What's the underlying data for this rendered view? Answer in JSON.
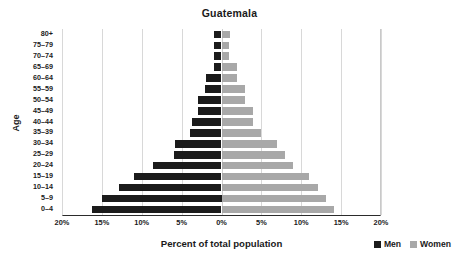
{
  "chart_data": {
    "type": "bar",
    "subtype": "population-pyramid",
    "title": "Guatemala",
    "xlabel": "Percent of total population",
    "ylabel": "Age",
    "categories": [
      "0–4",
      "5–9",
      "10–14",
      "15–19",
      "20–24",
      "25–29",
      "30–34",
      "35–39",
      "40–44",
      "45–49",
      "50–54",
      "55–59",
      "60–64",
      "65–69",
      "70–74",
      "75–79",
      "80+"
    ],
    "series": [
      {
        "name": "Men",
        "color": "#1b1b1b",
        "direction": "left",
        "values": [
          16.3,
          15.0,
          12.8,
          11.0,
          8.6,
          6.0,
          5.8,
          4.0,
          3.7,
          3.0,
          2.9,
          2.1,
          1.9,
          1.0,
          1.0,
          1.0,
          1.0
        ]
      },
      {
        "name": "Women",
        "color": "#a8a8a8",
        "direction": "right",
        "values": [
          14.1,
          13.1,
          12.1,
          11.0,
          9.0,
          8.0,
          7.0,
          5.0,
          4.0,
          4.0,
          3.0,
          3.0,
          2.0,
          2.0,
          1.0,
          1.0,
          1.1
        ]
      }
    ],
    "xlim": [
      -20,
      20
    ],
    "xticks": [
      -20,
      -15,
      -10,
      -5,
      0,
      5,
      10,
      15,
      20
    ],
    "xtick_labels": [
      "20%",
      "15%",
      "10%",
      "5%",
      "0%",
      "5%",
      "10%",
      "15%",
      "20%"
    ],
    "grid": true,
    "legend_position": "bottom-right",
    "legend": [
      {
        "label": "Men",
        "color": "#1b1b1b"
      },
      {
        "label": "Women",
        "color": "#a8a8a8"
      }
    ]
  }
}
